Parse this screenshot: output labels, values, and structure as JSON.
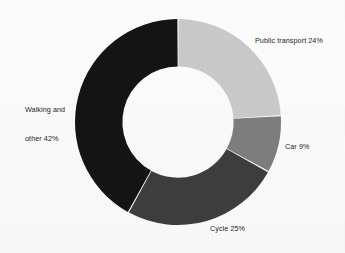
{
  "background_color": "#fbfbfb",
  "chart_data": {
    "type": "pie",
    "variant": "donut",
    "title": "",
    "subtitle": "",
    "xlabel": "",
    "ylabel": "",
    "legend_position": "none",
    "grid": false,
    "units": "percent",
    "total": 100,
    "start_angle_deg": 0,
    "direction": "clockwise",
    "inner_radius_ratio": 0.54,
    "categories": [
      "Public transport",
      "Car",
      "Cycle",
      "Walking and other"
    ],
    "values": [
      24,
      9,
      25,
      42
    ],
    "colors": [
      "#c9c9c9",
      "#7d7d7d",
      "#3d3d3d",
      "#141414"
    ],
    "slices": [
      {
        "name": "Public transport",
        "value": 24,
        "label": "Public transport 24%",
        "label_line1": "Public transport 24%",
        "label_line2": "",
        "color": "#c9c9c9",
        "start_deg": 0,
        "end_deg": 86.4
      },
      {
        "name": "Car",
        "value": 9,
        "label": "Car 9%",
        "label_line1": "Car 9%",
        "label_line2": "",
        "color": "#7d7d7d",
        "start_deg": 86.4,
        "end_deg": 118.8
      },
      {
        "name": "Cycle",
        "value": 25,
        "label": "Cycle 25%",
        "label_line1": "Cycle 25%",
        "label_line2": "",
        "color": "#3d3d3d",
        "start_deg": 118.8,
        "end_deg": 208.8
      },
      {
        "name": "Walking and other",
        "value": 42,
        "label": "Walking and other 42%",
        "label_line1": "Walking and",
        "label_line2": "other 42%",
        "color": "#141414",
        "start_deg": 208.8,
        "end_deg": 360
      }
    ]
  }
}
